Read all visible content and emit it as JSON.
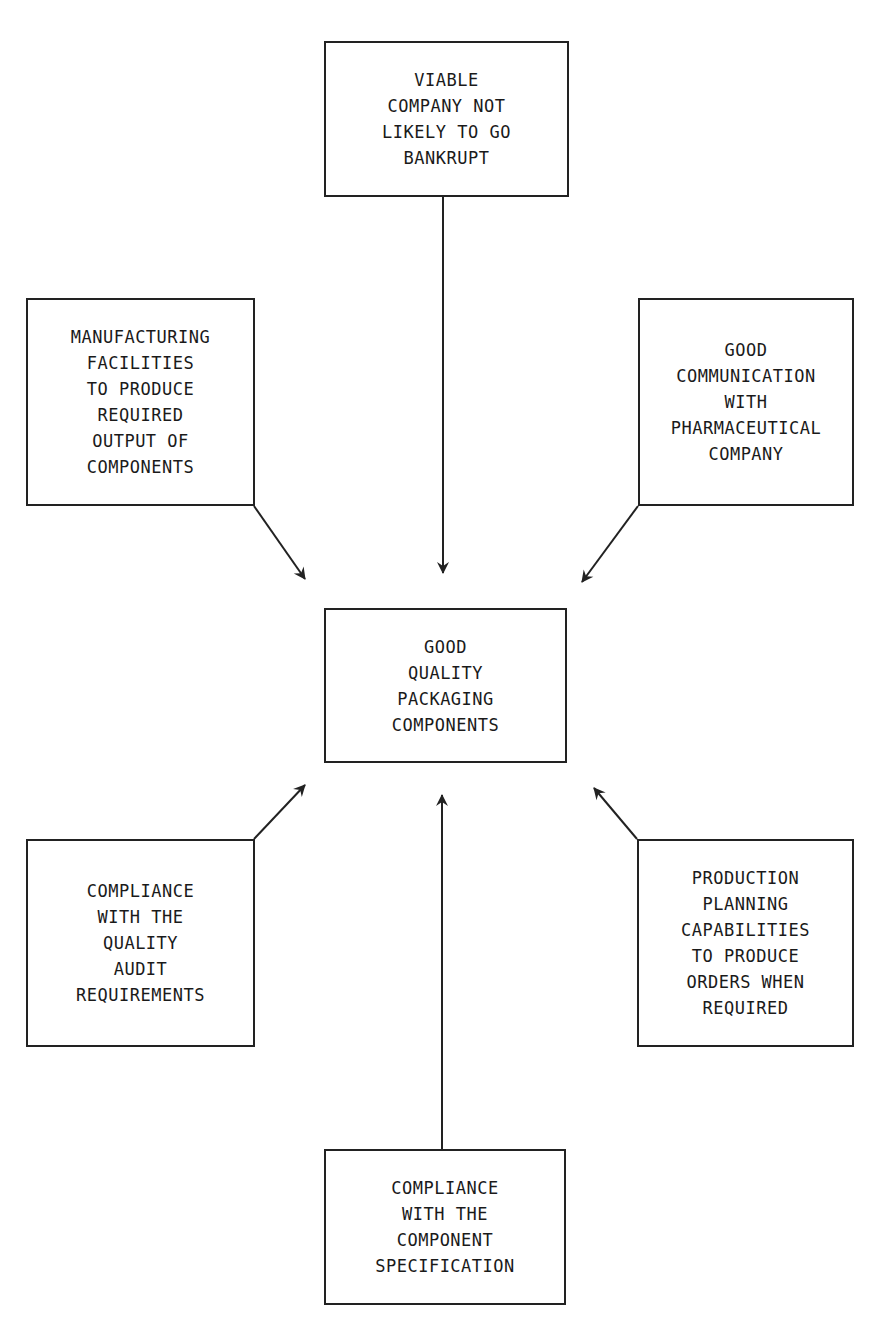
{
  "diagram": {
    "center": {
      "id": "center",
      "lines": [
        "GOOD",
        "QUALITY",
        "PACKAGING",
        "COMPONENTS"
      ],
      "x": 324,
      "y": 608,
      "w": 243,
      "h": 155
    },
    "nodes": [
      {
        "id": "top",
        "lines": [
          "VIABLE",
          "COMPANY NOT",
          "LIKELY TO GO",
          "BANKRUPT"
        ],
        "x": 324,
        "y": 41,
        "w": 245,
        "h": 156
      },
      {
        "id": "upper-left",
        "lines": [
          "MANUFACTURING",
          "FACILITIES",
          "TO PRODUCE",
          "REQUIRED",
          "OUTPUT OF",
          "COMPONENTS"
        ],
        "x": 26,
        "y": 298,
        "w": 229,
        "h": 208
      },
      {
        "id": "upper-right",
        "lines": [
          "GOOD",
          "COMMUNICATION",
          "WITH",
          "PHARMACEUTICAL",
          "COMPANY"
        ],
        "x": 638,
        "y": 298,
        "w": 216,
        "h": 208
      },
      {
        "id": "lower-left",
        "lines": [
          "COMPLIANCE",
          "WITH THE",
          "QUALITY",
          "AUDIT",
          "REQUIREMENTS"
        ],
        "x": 26,
        "y": 839,
        "w": 229,
        "h": 208
      },
      {
        "id": "lower-right",
        "lines": [
          "PRODUCTION",
          "PLANNING",
          "CAPABILITIES",
          "TO PRODUCE",
          "ORDERS WHEN",
          "REQUIRED"
        ],
        "x": 637,
        "y": 839,
        "w": 217,
        "h": 208
      },
      {
        "id": "bottom",
        "lines": [
          "COMPLIANCE",
          "WITH THE",
          "COMPONENT",
          "SPECIFICATION"
        ],
        "x": 324,
        "y": 1149,
        "w": 242,
        "h": 156
      }
    ],
    "arrows": [
      {
        "from": "top",
        "to": "center",
        "x1": 443,
        "y1": 197,
        "x2": 443,
        "y2": 573
      },
      {
        "from": "upper-left",
        "to": "center",
        "x1": 254,
        "y1": 506,
        "x2": 305,
        "y2": 579
      },
      {
        "from": "upper-right",
        "to": "center",
        "x1": 638,
        "y1": 506,
        "x2": 582,
        "y2": 582
      },
      {
        "from": "lower-left",
        "to": "center",
        "x1": 254,
        "y1": 839,
        "x2": 305,
        "y2": 785
      },
      {
        "from": "lower-right",
        "to": "center",
        "x1": 637,
        "y1": 839,
        "x2": 594,
        "y2": 788
      },
      {
        "from": "bottom",
        "to": "center",
        "x1": 442,
        "y1": 1149,
        "x2": 442,
        "y2": 795
      }
    ],
    "colors": {
      "stroke": "#222222",
      "text": "#1a1a1a",
      "background": "#ffffff"
    }
  }
}
